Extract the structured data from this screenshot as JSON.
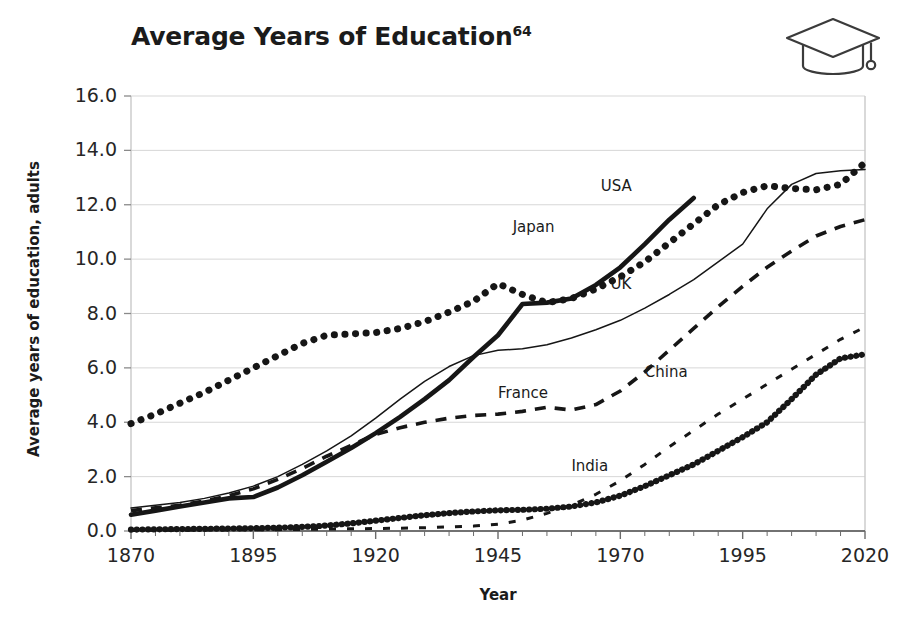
{
  "chart_data": {
    "type": "line",
    "title": "Average Years of Education",
    "title_superscript": "64",
    "xlabel": "Year",
    "ylabel": "Average years of education, adults",
    "xlim": [
      1870,
      2020
    ],
    "ylim": [
      0.0,
      16.0
    ],
    "xticks": [
      "1870",
      "1895",
      "1920",
      "1945",
      "1970",
      "1995",
      "2020"
    ],
    "xtick_values": [
      1870,
      1895,
      1920,
      1945,
      1970,
      1995,
      2020
    ],
    "xminor_step": 5,
    "yticks": [
      "0.0",
      "2.0",
      "4.0",
      "6.0",
      "8.0",
      "10.0",
      "12.0",
      "14.0",
      "16.0"
    ],
    "ytick_values": [
      0.0,
      2.0,
      4.0,
      6.0,
      8.0,
      10.0,
      12.0,
      14.0,
      16.0
    ],
    "grid": true,
    "grid_axis": "y",
    "legend": "inline-labels",
    "icon": "graduation-cap-icon",
    "series": [
      {
        "name": "USA",
        "style": "dotted-thick",
        "label_x": 1966,
        "label_y": 12.65,
        "x": [
          1870,
          1875,
          1880,
          1885,
          1890,
          1895,
          1900,
          1905,
          1910,
          1915,
          1920,
          1925,
          1930,
          1935,
          1940,
          1945,
          1950,
          1955,
          1960,
          1965,
          1970,
          1975,
          1980,
          1985,
          1990,
          1995,
          2000,
          2005,
          2010,
          2015,
          2020
        ],
        "y": [
          3.95,
          4.3,
          4.7,
          5.1,
          5.55,
          6.0,
          6.45,
          6.9,
          7.2,
          7.25,
          7.3,
          7.45,
          7.7,
          8.05,
          8.45,
          9.1,
          8.7,
          8.4,
          8.55,
          8.9,
          9.35,
          9.9,
          10.6,
          11.3,
          12.0,
          12.45,
          12.7,
          12.6,
          12.55,
          12.75,
          13.55
        ]
      },
      {
        "name": "Japan",
        "style": "solid-thick",
        "label_x": 1948,
        "label_y": 11.15,
        "x": [
          1870,
          1875,
          1880,
          1885,
          1890,
          1895,
          1900,
          1905,
          1910,
          1915,
          1920,
          1925,
          1930,
          1935,
          1940,
          1945,
          1950,
          1955,
          1960,
          1965,
          1970,
          1975,
          1980,
          1985
        ],
        "y": [
          0.6,
          0.75,
          0.9,
          1.05,
          1.2,
          1.25,
          1.6,
          2.05,
          2.55,
          3.05,
          3.6,
          4.2,
          4.85,
          5.55,
          6.4,
          7.2,
          8.35,
          8.4,
          8.55,
          9.05,
          9.7,
          10.55,
          11.45,
          12.25
        ]
      },
      {
        "name": "UK",
        "style": "solid-thin",
        "label_x": 1968,
        "label_y": 9.05,
        "x": [
          1870,
          1875,
          1880,
          1885,
          1890,
          1895,
          1900,
          1905,
          1910,
          1915,
          1920,
          1925,
          1930,
          1935,
          1940,
          1945,
          1950,
          1955,
          1960,
          1965,
          1970,
          1975,
          1980,
          1985,
          1990,
          1995,
          2000,
          2005,
          2010,
          2015,
          2020
        ],
        "y": [
          0.85,
          0.95,
          1.05,
          1.2,
          1.4,
          1.65,
          2.0,
          2.45,
          2.95,
          3.5,
          4.15,
          4.85,
          5.5,
          6.05,
          6.45,
          6.65,
          6.7,
          6.85,
          7.1,
          7.4,
          7.75,
          8.2,
          8.7,
          9.25,
          9.9,
          10.55,
          11.85,
          12.75,
          13.15,
          13.25,
          13.3
        ]
      },
      {
        "name": "France",
        "style": "dashed",
        "label_x": 1945,
        "label_y": 5.05,
        "x": [
          1870,
          1875,
          1880,
          1885,
          1890,
          1895,
          1900,
          1905,
          1910,
          1915,
          1920,
          1925,
          1930,
          1935,
          1940,
          1945,
          1950,
          1955,
          1960,
          1965,
          1970,
          1975,
          1980,
          1985,
          1990,
          1995,
          2000,
          2005,
          2010,
          2015,
          2020
        ],
        "y": [
          0.75,
          0.85,
          0.95,
          1.1,
          1.3,
          1.55,
          1.9,
          2.3,
          2.75,
          3.15,
          3.55,
          3.8,
          4.0,
          4.15,
          4.25,
          4.3,
          4.4,
          4.55,
          4.45,
          4.65,
          5.15,
          5.85,
          6.65,
          7.45,
          8.25,
          9.0,
          9.7,
          10.3,
          10.85,
          11.2,
          11.45
        ]
      },
      {
        "name": "China",
        "style": "dotted-sparse",
        "label_x": 1975,
        "label_y": 5.8,
        "x": [
          1870,
          1880,
          1890,
          1900,
          1910,
          1920,
          1930,
          1940,
          1945,
          1950,
          1955,
          1960,
          1965,
          1970,
          1975,
          1980,
          1985,
          1990,
          1995,
          2000,
          2005,
          2010,
          2015,
          2020
        ],
        "y": [
          0.02,
          0.03,
          0.04,
          0.05,
          0.07,
          0.09,
          0.12,
          0.18,
          0.25,
          0.4,
          0.65,
          0.95,
          1.35,
          1.85,
          2.45,
          3.1,
          3.7,
          4.3,
          4.85,
          5.4,
          5.95,
          6.5,
          7.05,
          7.5
        ]
      },
      {
        "name": "India",
        "style": "dotted-beaded",
        "label_x": 1960,
        "label_y": 2.35,
        "x": [
          1870,
          1875,
          1880,
          1885,
          1890,
          1895,
          1900,
          1905,
          1910,
          1915,
          1920,
          1925,
          1930,
          1935,
          1940,
          1945,
          1950,
          1955,
          1960,
          1965,
          1970,
          1975,
          1980,
          1985,
          1990,
          1995,
          2000,
          2005,
          2010,
          2015,
          2020
        ],
        "y": [
          0.05,
          0.06,
          0.07,
          0.08,
          0.09,
          0.1,
          0.12,
          0.15,
          0.2,
          0.28,
          0.38,
          0.48,
          0.58,
          0.66,
          0.72,
          0.76,
          0.78,
          0.82,
          0.9,
          1.05,
          1.3,
          1.65,
          2.05,
          2.45,
          2.95,
          3.45,
          4.0,
          4.85,
          5.75,
          6.35,
          6.5
        ]
      }
    ]
  }
}
